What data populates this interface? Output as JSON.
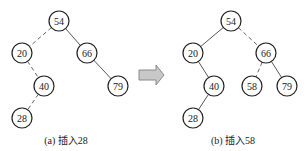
{
  "figure_a": {
    "caption": "(a) 插入28",
    "nodes": [
      {
        "id": "54",
        "label": "54",
        "x": 59,
        "y": 21
      },
      {
        "id": "20",
        "label": "20",
        "x": 22,
        "y": 53
      },
      {
        "id": "66",
        "label": "66",
        "x": 87,
        "y": 53
      },
      {
        "id": "40",
        "label": "40",
        "x": 44,
        "y": 86
      },
      {
        "id": "79",
        "label": "79",
        "x": 118,
        "y": 86
      },
      {
        "id": "28",
        "label": "28",
        "x": 22,
        "y": 118
      }
    ],
    "edges": [
      {
        "from": "54",
        "to": "20",
        "style": "dashed"
      },
      {
        "from": "54",
        "to": "66",
        "style": "solid"
      },
      {
        "from": "20",
        "to": "40",
        "style": "dashed"
      },
      {
        "from": "66",
        "to": "79",
        "style": "solid"
      },
      {
        "from": "40",
        "to": "28",
        "style": "dashed"
      }
    ]
  },
  "figure_b": {
    "caption": "(b) 插入58",
    "nodes": [
      {
        "id": "54",
        "label": "54",
        "x": 231,
        "y": 21
      },
      {
        "id": "20",
        "label": "20",
        "x": 193,
        "y": 53
      },
      {
        "id": "66",
        "label": "66",
        "x": 266,
        "y": 53
      },
      {
        "id": "40",
        "label": "40",
        "x": 214,
        "y": 86
      },
      {
        "id": "58",
        "label": "58",
        "x": 252,
        "y": 86
      },
      {
        "id": "79",
        "label": "79",
        "x": 287,
        "y": 86
      },
      {
        "id": "28",
        "label": "28",
        "x": 193,
        "y": 118
      }
    ],
    "edges": [
      {
        "from": "54",
        "to": "20",
        "style": "solid"
      },
      {
        "from": "54",
        "to": "66",
        "style": "dashed"
      },
      {
        "from": "20",
        "to": "40",
        "style": "solid"
      },
      {
        "from": "66",
        "to": "58",
        "style": "dashed"
      },
      {
        "from": "66",
        "to": "79",
        "style": "solid"
      },
      {
        "from": "40",
        "to": "28",
        "style": "solid"
      }
    ]
  },
  "arrow": {
    "icon": "right-arrow-icon",
    "fill": "#c8c8c8",
    "stroke": "#8a8a8a"
  },
  "node_radius": 10
}
